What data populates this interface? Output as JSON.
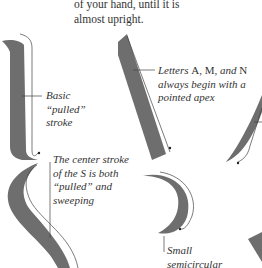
{
  "intro_text": {
    "line1": "of your hand, until it is",
    "line2": "almost upright."
  },
  "captions": {
    "pulled_stroke": {
      "line1": "Basic",
      "line2": "“pulled”",
      "line3": "stroke"
    },
    "apex": {
      "line1_prefix": "Letters ",
      "letter_a": "A",
      "sep1": ", ",
      "letter_m": "M",
      "sep2": ", ",
      "and": "and",
      "letter_n": " N",
      "line2": "always begin with a",
      "line3": "pointed apex"
    },
    "s_center": {
      "line1": "The center stroke",
      "line2": "of the S is both",
      "line3": "“pulled” and",
      "line4": "sweeping"
    },
    "semicircular": {
      "line1": "Small",
      "line2": "semicircular"
    }
  },
  "colors": {
    "stroke_fill": "#6e6e6e",
    "guide_line": "#444444",
    "text": "#333333"
  }
}
